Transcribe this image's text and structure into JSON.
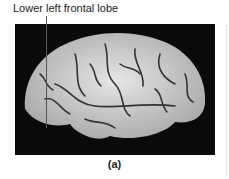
{
  "figure": {
    "annotation": "Lower left frontal lobe",
    "caption": "(a)",
    "image_description": "Lateral view photograph of a human brain on black background"
  }
}
